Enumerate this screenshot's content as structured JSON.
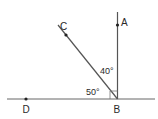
{
  "diagram": {
    "type": "geometry-angles",
    "colors": {
      "line": "#555555",
      "point": "#222222",
      "text": "#2a2a2a",
      "background": "#ffffff"
    },
    "points": {
      "A": {
        "label": "A"
      },
      "B": {
        "label": "B"
      },
      "C": {
        "label": "C"
      },
      "D": {
        "label": "D"
      }
    },
    "angles": {
      "ABC": {
        "label": "40°"
      },
      "CBD": {
        "label": "50°"
      }
    },
    "right_angle_marker": {
      "at": "B",
      "between": [
        "BA",
        "BD"
      ]
    }
  }
}
